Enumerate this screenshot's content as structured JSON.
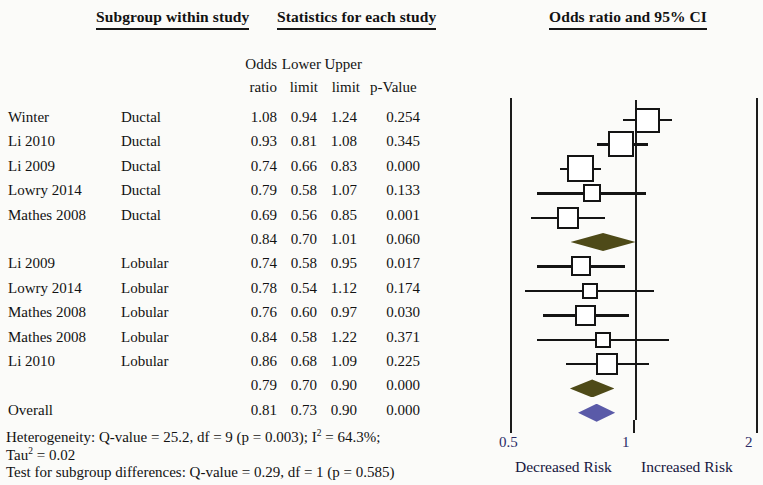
{
  "headers": {
    "subgroup": "Subgroup within study",
    "statistics": "Statistics for each study",
    "plot": "Odds ratio and 95% CI"
  },
  "column_headers": {
    "odds": "Odds",
    "ratio": "ratio",
    "lower": "Lower",
    "lower2": "limit",
    "upper": "Upper",
    "upper2": "limit",
    "pvalue": "p-Value"
  },
  "rows": [
    {
      "study": "Winter",
      "subgroup": "Ductal",
      "or": "1.08",
      "ll": "0.94",
      "ul": "1.24",
      "p": "0.254",
      "kind": "study"
    },
    {
      "study": "Li 2010",
      "subgroup": "Ductal",
      "or": "0.93",
      "ll": "0.81",
      "ul": "1.08",
      "p": "0.345",
      "kind": "study"
    },
    {
      "study": "Li 2009",
      "subgroup": "Ductal",
      "or": "0.74",
      "ll": "0.66",
      "ul": "0.83",
      "p": "0.000",
      "kind": "study"
    },
    {
      "study": "Lowry 2014",
      "subgroup": "Ductal",
      "or": "0.79",
      "ll": "0.58",
      "ul": "1.07",
      "p": "0.133",
      "kind": "study"
    },
    {
      "study": "Mathes 2008",
      "subgroup": "Ductal",
      "or": "0.69",
      "ll": "0.56",
      "ul": "0.85",
      "p": "0.001",
      "kind": "study"
    },
    {
      "study": "",
      "subgroup": "",
      "or": "0.84",
      "ll": "0.70",
      "ul": "1.01",
      "p": "0.060",
      "kind": "subtotal"
    },
    {
      "study": "Li 2009",
      "subgroup": "Lobular",
      "or": "0.74",
      "ll": "0.58",
      "ul": "0.95",
      "p": "0.017",
      "kind": "study"
    },
    {
      "study": "Lowry 2014",
      "subgroup": "Lobular",
      "or": "0.78",
      "ll": "0.54",
      "ul": "1.12",
      "p": "0.174",
      "kind": "study"
    },
    {
      "study": "Mathes 2008",
      "subgroup": "Lobular",
      "or": "0.76",
      "ll": "0.60",
      "ul": "0.97",
      "p": "0.030",
      "kind": "study"
    },
    {
      "study": "Mathes 2008",
      "subgroup": "Lobular",
      "or": "0.84",
      "ll": "0.58",
      "ul": "1.22",
      "p": "0.371",
      "kind": "study"
    },
    {
      "study": "Li 2010",
      "subgroup": "Lobular",
      "or": "0.86",
      "ll": "0.68",
      "ul": "1.09",
      "p": "0.225",
      "kind": "study"
    },
    {
      "study": "",
      "subgroup": "",
      "or": "0.79",
      "ll": "0.70",
      "ul": "0.90",
      "p": "0.000",
      "kind": "subtotal"
    },
    {
      "study": "Overall",
      "subgroup": "",
      "or": "0.81",
      "ll": "0.73",
      "ul": "0.90",
      "p": "0.000",
      "kind": "overall"
    }
  ],
  "notes": {
    "heterogeneity_prefix": "Heterogeneity: Q-value = 25.2, df = 9 (p = 0.003); I",
    "heterogeneity_sup": "2",
    "heterogeneity_suffix": " = 64.3%;",
    "tau_prefix": "Tau",
    "tau_sup": "2",
    "tau_suffix": " = 0.02",
    "subgroup_test": "Test for subgroup differences: Q-value = 0.29, df = 1 (p = 0.585)"
  },
  "axis": {
    "ticks": [
      "0.5",
      "1",
      "2"
    ],
    "tick_values": [
      0.5,
      1,
      2
    ],
    "left_caption": "Decreased Risk",
    "right_caption": "Increased Risk",
    "scale": "log",
    "x_min": 0.5,
    "x_max": 2
  },
  "colors": {
    "subtotal_diamond": "#4e4a18",
    "overall_diamond": "#5a5aa8",
    "marker_outline": "#141414",
    "axis": "#1b1b1b",
    "tick_label": "#2a2a66"
  },
  "chart_data": {
    "type": "forest",
    "title": "Odds ratio and 95% CI",
    "xlabel": "Odds ratio",
    "xlim": [
      0.5,
      2
    ],
    "xscale": "log",
    "xticks": [
      0.5,
      1,
      2
    ],
    "reference_line": 1,
    "grid": false,
    "legend": null,
    "annotations": [
      "Decreased Risk",
      "Increased Risk"
    ],
    "series": [
      {
        "name": "Winter",
        "subgroup": "Ductal",
        "or": 1.08,
        "ll": 0.94,
        "ul": 1.24,
        "p": 0.254,
        "weight": 0.155,
        "marker": "square"
      },
      {
        "name": "Li 2010",
        "subgroup": "Ductal",
        "or": 0.93,
        "ll": 0.81,
        "ul": 1.08,
        "p": 0.345,
        "weight": 0.16,
        "marker": "square"
      },
      {
        "name": "Li 2009",
        "subgroup": "Ductal",
        "or": 0.74,
        "ll": 0.66,
        "ul": 0.83,
        "p": 0.0,
        "weight": 0.17,
        "marker": "square"
      },
      {
        "name": "Lowry 2014",
        "subgroup": "Ductal",
        "or": 0.79,
        "ll": 0.58,
        "ul": 1.07,
        "p": 0.133,
        "weight": 0.09,
        "marker": "square"
      },
      {
        "name": "Mathes 2008",
        "subgroup": "Ductal",
        "or": 0.69,
        "ll": 0.56,
        "ul": 0.85,
        "p": 0.001,
        "weight": 0.125,
        "marker": "square"
      },
      {
        "name": "Ductal subtotal",
        "subgroup": "Ductal",
        "or": 0.84,
        "ll": 0.7,
        "ul": 1.01,
        "p": 0.06,
        "marker": "diamond"
      },
      {
        "name": "Li 2009",
        "subgroup": "Lobular",
        "or": 0.74,
        "ll": 0.58,
        "ul": 0.95,
        "p": 0.017,
        "weight": 0.11,
        "marker": "square"
      },
      {
        "name": "Lowry 2014",
        "subgroup": "Lobular",
        "or": 0.78,
        "ll": 0.54,
        "ul": 1.12,
        "p": 0.174,
        "weight": 0.07,
        "marker": "square"
      },
      {
        "name": "Mathes 2008",
        "subgroup": "Lobular",
        "or": 0.76,
        "ll": 0.6,
        "ul": 0.97,
        "p": 0.03,
        "weight": 0.115,
        "marker": "square"
      },
      {
        "name": "Mathes 2008",
        "subgroup": "Lobular",
        "or": 0.84,
        "ll": 0.58,
        "ul": 1.22,
        "p": 0.371,
        "weight": 0.075,
        "marker": "square"
      },
      {
        "name": "Li 2010",
        "subgroup": "Lobular",
        "or": 0.86,
        "ll": 0.68,
        "ul": 1.09,
        "p": 0.225,
        "weight": 0.13,
        "marker": "square"
      },
      {
        "name": "Lobular subtotal",
        "subgroup": "Lobular",
        "or": 0.79,
        "ll": 0.7,
        "ul": 0.9,
        "p": 0.0,
        "marker": "diamond"
      },
      {
        "name": "Overall",
        "subgroup": "",
        "or": 0.81,
        "ll": 0.73,
        "ul": 0.9,
        "p": 0.0,
        "marker": "diamond"
      }
    ]
  }
}
